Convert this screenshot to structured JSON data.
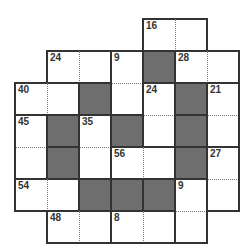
{
  "puzzle": {
    "type": "sum-cage grid",
    "rows": 7,
    "cols": 7,
    "origin": {
      "x": 15,
      "y": 19
    },
    "cell_size": 32,
    "colors": {
      "black": "#6e6e6e",
      "line": "#333333",
      "dotted": "#777777",
      "clue": "#333333"
    },
    "cells": [
      {
        "r": 0,
        "c": 4,
        "black": false
      },
      {
        "r": 0,
        "c": 5,
        "black": false
      },
      {
        "r": 1,
        "c": 1,
        "black": false
      },
      {
        "r": 1,
        "c": 2,
        "black": false
      },
      {
        "r": 1,
        "c": 3,
        "black": false
      },
      {
        "r": 1,
        "c": 4,
        "black": true
      },
      {
        "r": 1,
        "c": 5,
        "black": false
      },
      {
        "r": 1,
        "c": 6,
        "black": false
      },
      {
        "r": 2,
        "c": 0,
        "black": false
      },
      {
        "r": 2,
        "c": 1,
        "black": false
      },
      {
        "r": 2,
        "c": 2,
        "black": true
      },
      {
        "r": 2,
        "c": 3,
        "black": false
      },
      {
        "r": 2,
        "c": 4,
        "black": false
      },
      {
        "r": 2,
        "c": 5,
        "black": true
      },
      {
        "r": 2,
        "c": 6,
        "black": false
      },
      {
        "r": 3,
        "c": 0,
        "black": false
      },
      {
        "r": 3,
        "c": 1,
        "black": true
      },
      {
        "r": 3,
        "c": 2,
        "black": false
      },
      {
        "r": 3,
        "c": 3,
        "black": true
      },
      {
        "r": 3,
        "c": 4,
        "black": false
      },
      {
        "r": 3,
        "c": 5,
        "black": true
      },
      {
        "r": 3,
        "c": 6,
        "black": false
      },
      {
        "r": 4,
        "c": 0,
        "black": false
      },
      {
        "r": 4,
        "c": 1,
        "black": true
      },
      {
        "r": 4,
        "c": 2,
        "black": false
      },
      {
        "r": 4,
        "c": 3,
        "black": false
      },
      {
        "r": 4,
        "c": 4,
        "black": false
      },
      {
        "r": 4,
        "c": 5,
        "black": true
      },
      {
        "r": 4,
        "c": 6,
        "black": false
      },
      {
        "r": 5,
        "c": 0,
        "black": false
      },
      {
        "r": 5,
        "c": 1,
        "black": false
      },
      {
        "r": 5,
        "c": 2,
        "black": true
      },
      {
        "r": 5,
        "c": 3,
        "black": true
      },
      {
        "r": 5,
        "c": 4,
        "black": true
      },
      {
        "r": 5,
        "c": 5,
        "black": false
      },
      {
        "r": 5,
        "c": 6,
        "black": false
      },
      {
        "r": 6,
        "c": 1,
        "black": false
      },
      {
        "r": 6,
        "c": 2,
        "black": false
      },
      {
        "r": 6,
        "c": 3,
        "black": false
      },
      {
        "r": 6,
        "c": 4,
        "black": false
      },
      {
        "r": 6,
        "c": 5,
        "black": false
      }
    ],
    "cages": [
      {
        "sum": "16",
        "cells": [
          [
            0,
            4
          ],
          [
            0,
            5
          ]
        ]
      },
      {
        "sum": "24",
        "cells": [
          [
            1,
            1
          ],
          [
            1,
            2
          ]
        ]
      },
      {
        "sum": "9",
        "cells": [
          [
            1,
            3
          ],
          [
            2,
            3
          ]
        ]
      },
      {
        "sum": "28",
        "cells": [
          [
            1,
            5
          ],
          [
            1,
            6
          ]
        ]
      },
      {
        "sum": "40",
        "cells": [
          [
            2,
            0
          ],
          [
            2,
            1
          ]
        ]
      },
      {
        "sum": "24",
        "cells": [
          [
            2,
            4
          ],
          [
            3,
            4
          ]
        ]
      },
      {
        "sum": "21",
        "cells": [
          [
            2,
            6
          ],
          [
            3,
            6
          ]
        ]
      },
      {
        "sum": "45",
        "cells": [
          [
            3,
            0
          ],
          [
            4,
            0
          ]
        ]
      },
      {
        "sum": "35",
        "cells": [
          [
            3,
            2
          ],
          [
            4,
            2
          ]
        ]
      },
      {
        "sum": "56",
        "cells": [
          [
            4,
            3
          ],
          [
            4,
            4
          ]
        ]
      },
      {
        "sum": "27",
        "cells": [
          [
            4,
            6
          ],
          [
            5,
            6
          ]
        ]
      },
      {
        "sum": "54",
        "cells": [
          [
            5,
            0
          ],
          [
            5,
            1
          ]
        ]
      },
      {
        "sum": "9",
        "cells": [
          [
            5,
            5
          ],
          [
            6,
            5
          ]
        ]
      },
      {
        "sum": "48",
        "cells": [
          [
            6,
            1
          ],
          [
            6,
            2
          ]
        ]
      },
      {
        "sum": "8",
        "cells": [
          [
            6,
            3
          ],
          [
            6,
            4
          ]
        ]
      }
    ]
  }
}
